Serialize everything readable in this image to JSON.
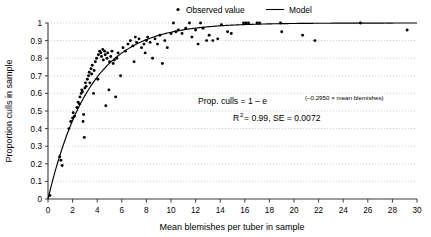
{
  "chart_data": {
    "type": "scatter",
    "title": "",
    "xlabel": "Mean blemishes per tuber in sample",
    "ylabel": "Proportion culls in sample",
    "xlim": [
      0,
      30
    ],
    "ylim": [
      0,
      1
    ],
    "xticks": [
      "0",
      "2",
      "4",
      "6",
      "8",
      "10",
      "12",
      "14",
      "16",
      "18",
      "20",
      "22",
      "24",
      "26",
      "28",
      "30"
    ],
    "yticks": [
      "0",
      "0.1",
      "0.2",
      "0.3",
      "0.4",
      "0.5",
      "0.6",
      "0.7",
      "0.8",
      "0.9",
      "1"
    ],
    "grid": "horizontal-dotted",
    "legend_position": "top-center",
    "legend": [
      {
        "name": "Observed value",
        "marker": "dot",
        "color": "#000000"
      },
      {
        "name": "Model",
        "marker": "line",
        "color": "#000000"
      }
    ],
    "annotations": [
      {
        "id": "equation",
        "text": "Prop. culls = 1 – e(–0.2950 × mean blemishes)",
        "parts": {
          "lead": "Prop. culls = 1 – e",
          "exponent": "(–0.2950 × mean blemishes)"
        }
      },
      {
        "id": "fit-stats",
        "text": "R2 = 0.99, SE = 0.0072",
        "parts": {
          "r_base": "R",
          "r_sup": "2",
          "rest": " = 0.99, SE = 0.0072"
        }
      }
    ],
    "series": [
      {
        "name": "Observed value",
        "type": "scatter",
        "marker": "dot",
        "color": "#000000",
        "points": [
          [
            0.15,
            0.02
          ],
          [
            0.95,
            0.24
          ],
          [
            1.05,
            0.22
          ],
          [
            1.15,
            0.19
          ],
          [
            1.7,
            0.4
          ],
          [
            1.85,
            0.44
          ],
          [
            2.0,
            0.46
          ],
          [
            2.05,
            0.49
          ],
          [
            2.15,
            0.47
          ],
          [
            2.35,
            0.52
          ],
          [
            2.45,
            0.55
          ],
          [
            2.55,
            0.54
          ],
          [
            2.6,
            0.58
          ],
          [
            2.7,
            0.6
          ],
          [
            2.75,
            0.62
          ],
          [
            2.8,
            0.61
          ],
          [
            2.85,
            0.44
          ],
          [
            2.9,
            0.48
          ],
          [
            2.95,
            0.35
          ],
          [
            3.0,
            0.63
          ],
          [
            3.05,
            0.66
          ],
          [
            3.1,
            0.64
          ],
          [
            3.2,
            0.68
          ],
          [
            3.3,
            0.7
          ],
          [
            3.35,
            0.72
          ],
          [
            3.4,
            0.66
          ],
          [
            3.5,
            0.74
          ],
          [
            3.55,
            0.71
          ],
          [
            3.6,
            0.76
          ],
          [
            3.7,
            0.6
          ],
          [
            3.75,
            0.73
          ],
          [
            3.85,
            0.78
          ],
          [
            3.95,
            0.8
          ],
          [
            4.05,
            0.68
          ],
          [
            4.1,
            0.82
          ],
          [
            4.2,
            0.84
          ],
          [
            4.3,
            0.83
          ],
          [
            4.35,
            0.81
          ],
          [
            4.45,
            0.85
          ],
          [
            4.5,
            0.79
          ],
          [
            4.6,
            0.84
          ],
          [
            4.65,
            0.82
          ],
          [
            4.7,
            0.53
          ],
          [
            4.8,
            0.8
          ],
          [
            4.85,
            0.83
          ],
          [
            4.95,
            0.62
          ],
          [
            5.0,
            0.78
          ],
          [
            5.1,
            0.81
          ],
          [
            5.2,
            0.84
          ],
          [
            5.3,
            0.77
          ],
          [
            5.4,
            0.79
          ],
          [
            5.5,
            0.58
          ],
          [
            5.6,
            0.8
          ],
          [
            5.7,
            0.83
          ],
          [
            5.9,
            0.7
          ],
          [
            6.1,
            0.86
          ],
          [
            6.3,
            0.84
          ],
          [
            6.5,
            0.88
          ],
          [
            6.7,
            0.9
          ],
          [
            6.9,
            0.87
          ],
          [
            7.0,
            0.78
          ],
          [
            7.1,
            0.92
          ],
          [
            7.2,
            0.89
          ],
          [
            7.4,
            0.91
          ],
          [
            7.6,
            0.86
          ],
          [
            7.8,
            0.88
          ],
          [
            7.9,
            0.83
          ],
          [
            8.0,
            0.9
          ],
          [
            8.1,
            0.92
          ],
          [
            8.3,
            0.89
          ],
          [
            8.5,
            0.8
          ],
          [
            8.7,
            0.91
          ],
          [
            8.9,
            0.88
          ],
          [
            9.1,
            0.93
          ],
          [
            9.3,
            0.77
          ],
          [
            9.5,
            0.9
          ],
          [
            9.7,
            0.86
          ],
          [
            10.0,
            0.94
          ],
          [
            10.2,
            1.0
          ],
          [
            10.4,
            0.95
          ],
          [
            10.6,
            0.96
          ],
          [
            10.9,
            0.94
          ],
          [
            11.2,
            0.97
          ],
          [
            11.5,
            1.0
          ],
          [
            11.7,
            0.92
          ],
          [
            12.0,
            0.96
          ],
          [
            12.2,
            0.88
          ],
          [
            12.4,
            1.0
          ],
          [
            12.6,
            0.97
          ],
          [
            12.9,
            0.9
          ],
          [
            13.1,
            0.93
          ],
          [
            13.4,
            0.9
          ],
          [
            13.8,
            0.91
          ],
          [
            14.1,
            0.99
          ],
          [
            14.6,
            0.95
          ],
          [
            14.9,
            0.94
          ],
          [
            15.9,
            1.0
          ],
          [
            16.1,
            1.0
          ],
          [
            16.3,
            1.0
          ],
          [
            17.0,
            1.0
          ],
          [
            17.2,
            1.0
          ],
          [
            18.9,
            1.0
          ],
          [
            19.0,
            0.95
          ],
          [
            20.7,
            0.93
          ],
          [
            21.7,
            0.9
          ],
          [
            25.4,
            1.0
          ],
          [
            29.2,
            0.96
          ]
        ]
      },
      {
        "name": "Model",
        "type": "line",
        "color": "#000000",
        "equation": "y = 1 - exp(-0.2950 * x)",
        "rate": 0.295,
        "r_squared": 0.99,
        "standard_error": 0.0072
      }
    ]
  }
}
